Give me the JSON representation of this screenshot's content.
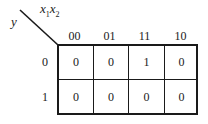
{
  "kmap": {
    "column_variables": "x1x2",
    "column_var_1": "x",
    "column_var_1_sub": "1",
    "column_var_2": "x",
    "column_var_2_sub": "2",
    "row_variable": "y",
    "column_headers": [
      "00",
      "01",
      "11",
      "10"
    ],
    "row_headers": [
      "0",
      "1"
    ],
    "cells": [
      [
        "0",
        "0",
        "1",
        "0"
      ],
      [
        "0",
        "0",
        "0",
        "0"
      ]
    ],
    "line_color": "#1a1a1a",
    "background": "#ffffff"
  }
}
